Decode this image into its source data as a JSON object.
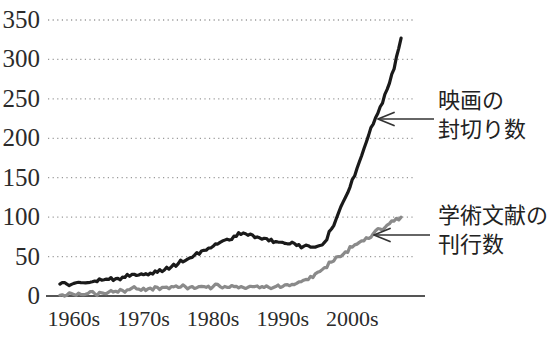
{
  "chart_data": {
    "type": "line",
    "title": "",
    "xlabel": "",
    "ylabel": "",
    "xlim": [
      1956,
      2009
    ],
    "ylim": [
      0,
      350
    ],
    "grid": true,
    "grid_style": "dotted-horizontal",
    "legend_position": "inline-annotations-right",
    "y_ticks": [
      0,
      50,
      100,
      150,
      200,
      250,
      300,
      350
    ],
    "y_tick_labels": [
      "0",
      "50",
      "100",
      "150",
      "200",
      "250",
      "300",
      "350"
    ],
    "x_ticks": [
      1960,
      1970,
      1980,
      1990,
      2000
    ],
    "x_tick_labels": [
      "1960s",
      "1970s",
      "1980s",
      "1990s",
      "2000s"
    ],
    "series": [
      {
        "name": "映画の封切り数",
        "color": "#1a1a1a",
        "annotation": [
          "映画の",
          "封切り数"
        ],
        "x": [
          1958,
          1959,
          1960,
          1961,
          1962,
          1963,
          1964,
          1965,
          1966,
          1967,
          1968,
          1969,
          1970,
          1971,
          1972,
          1973,
          1974,
          1975,
          1976,
          1977,
          1978,
          1979,
          1980,
          1981,
          1982,
          1983,
          1984,
          1985,
          1986,
          1987,
          1988,
          1989,
          1990,
          1991,
          1992,
          1993,
          1994,
          1995,
          1996,
          1997,
          1998,
          1999,
          2000,
          2001,
          2002,
          2003,
          2004,
          2005,
          2006,
          2007
        ],
        "values": [
          15,
          15,
          16,
          17,
          17,
          19,
          20,
          21,
          22,
          24,
          25,
          26,
          27,
          29,
          30,
          33,
          37,
          41,
          45,
          49,
          53,
          58,
          63,
          68,
          72,
          76,
          78,
          77,
          74,
          72,
          70,
          69,
          68,
          66,
          64,
          63,
          62,
          63,
          68,
          85,
          105,
          125,
          148,
          170,
          195,
          218,
          240,
          262,
          288,
          327
        ]
      },
      {
        "name": "学術文献の刊行数",
        "color": "#8a8a8a",
        "annotation": [
          "学術文献の",
          "刊行数"
        ],
        "x": [
          1958,
          1959,
          1960,
          1961,
          1962,
          1963,
          1964,
          1965,
          1966,
          1967,
          1968,
          1969,
          1970,
          1971,
          1972,
          1973,
          1974,
          1975,
          1976,
          1977,
          1978,
          1979,
          1980,
          1981,
          1982,
          1983,
          1984,
          1985,
          1986,
          1987,
          1988,
          1989,
          1990,
          1991,
          1992,
          1993,
          1994,
          1995,
          1996,
          1997,
          1998,
          1999,
          2000,
          2001,
          2002,
          2003,
          2004,
          2005,
          2006,
          2007
        ],
        "values": [
          1,
          1,
          2,
          2,
          3,
          3,
          4,
          5,
          6,
          7,
          8,
          9,
          10,
          10,
          11,
          11,
          12,
          11,
          12,
          12,
          12,
          11,
          12,
          12,
          11,
          12,
          12,
          11,
          12,
          12,
          11,
          12,
          12,
          13,
          16,
          20,
          25,
          30,
          36,
          43,
          50,
          56,
          62,
          68,
          74,
          79,
          85,
          90,
          95,
          100
        ]
      }
    ],
    "annotations": [
      {
        "name": "movie-releases-annotation",
        "lines": [
          "映画の",
          "封切り数"
        ],
        "arrow": "left",
        "target_series": "映画の封切り数"
      },
      {
        "name": "academic-publications-annotation",
        "lines": [
          "学術文献の",
          "刊行数"
        ],
        "arrow": "left",
        "target_series": "学術文献の刊行数"
      }
    ]
  },
  "axis": {
    "y_labels": [
      "350",
      "300",
      "250",
      "200",
      "150",
      "100",
      "50",
      "0"
    ],
    "x_labels": [
      "1960s",
      "1970s",
      "1980s",
      "1990s",
      "2000s"
    ]
  },
  "colors": {
    "dark_series": "#1a1a1a",
    "gray_series": "#8a8a8a",
    "gridline": "#9a9a9a",
    "axis": "#555555",
    "text": "#2b2b2b"
  }
}
